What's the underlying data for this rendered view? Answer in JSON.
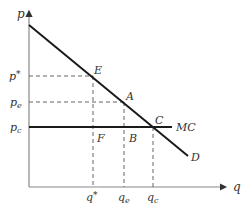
{
  "diagram": {
    "type": "monopoly-vs-competition",
    "axes": {
      "y_label": "p",
      "x_label": "q"
    },
    "price_labels": {
      "p_star": {
        "base": "p",
        "sup": "*"
      },
      "p_e": {
        "base": "p",
        "sub": "e"
      },
      "p_c": {
        "base": "p",
        "sub": "c"
      }
    },
    "quantity_labels": {
      "q_star": {
        "base": "q",
        "sup": "*"
      },
      "q_e": {
        "base": "q",
        "sub": "e"
      },
      "q_c": {
        "base": "q",
        "sub": "c"
      }
    },
    "point_labels": {
      "E": "E",
      "A": "A",
      "C": "C",
      "F": "F",
      "B": "B"
    },
    "curve_labels": {
      "demand": "D",
      "marginal_cost": "MC"
    },
    "colors": {
      "curve": "#1a1a1a",
      "axis": "#888888",
      "dash": "#555555"
    }
  }
}
